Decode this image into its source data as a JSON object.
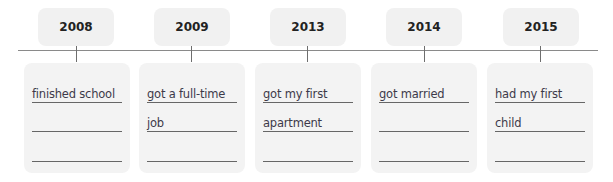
{
  "timeline": {
    "events": [
      {
        "year": "2008",
        "lines": [
          "finished school",
          "",
          ""
        ]
      },
      {
        "year": "2009",
        "lines": [
          "got a full-time",
          "job",
          ""
        ]
      },
      {
        "year": "2013",
        "lines": [
          "got my first",
          "apartment",
          ""
        ]
      },
      {
        "year": "2014",
        "lines": [
          "got married",
          "",
          ""
        ]
      },
      {
        "year": "2015",
        "lines": [
          "had my first",
          "child",
          ""
        ]
      }
    ]
  },
  "colors": {
    "box_fill": "#f1f1f1",
    "line": "#8a8a8a",
    "handwriting": "#3d3a4a"
  }
}
